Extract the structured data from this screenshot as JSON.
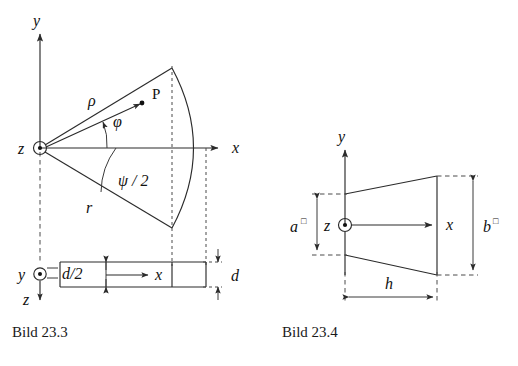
{
  "page": {
    "background": "#ffffff",
    "ink": "#1a1a1a",
    "width": 518,
    "height": 366
  },
  "figures": [
    {
      "id": "bild-23-3",
      "caption": "Bild 23.3",
      "description": "Kreissektor in der xy-Ebene mit Polarkoordinaten und Seitenansicht",
      "labels": {
        "axis_y": "y",
        "axis_x": "x",
        "axis_z": "z",
        "radius_vector": "ρ",
        "angle_phi": "φ",
        "point_p": "P",
        "radius_r": "r",
        "half_angle": "ψ / 2",
        "axis_y_side": "y",
        "axis_x_side": "x",
        "axis_z_side": "z",
        "offset": "d/2",
        "thickness": "d"
      },
      "origin_marker": "circle-with-center-dot"
    },
    {
      "id": "bild-23-4",
      "caption": "Bild 23.4",
      "description": "Trapezquerschnitt mit Hoehen a und b und Breite h",
      "labels": {
        "axis_y": "y",
        "axis_x": "x",
        "axis_z": "z",
        "height_left": "a",
        "height_left_sup": "□",
        "height_right": "b",
        "height_right_sup": "□",
        "width": "h"
      },
      "origin_marker": "circle-with-center-dot"
    }
  ]
}
